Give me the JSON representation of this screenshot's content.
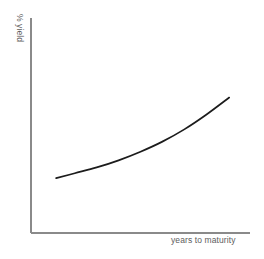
{
  "chart_data": {
    "type": "line",
    "title": "",
    "subtitle": "",
    "xlabel": "years to maturity",
    "ylabel": "% yield",
    "legend": [],
    "legend_position": "none",
    "grid": false,
    "axis_ticks": false,
    "tick_labels": {
      "x": [],
      "y": []
    },
    "xlim": [
      0,
      10
    ],
    "ylim": [
      0,
      10
    ],
    "annotations": [],
    "series": [
      {
        "name": "yield curve",
        "color": "#1c1c1c",
        "x": [
          1.15,
          2.0,
          3.0,
          4.0,
          5.0,
          6.0,
          7.0,
          8.0,
          9.05
        ],
        "y": [
          2.55,
          2.78,
          3.05,
          3.38,
          3.78,
          4.25,
          4.82,
          5.5,
          6.3
        ]
      }
    ]
  },
  "axes": {
    "y_axis_name": "y-axis",
    "x_axis_name": "x-axis"
  },
  "colors": {
    "background": "#ffffff",
    "axis": "#8a8a8a",
    "curve": "#1c1c1c",
    "label_text": "#5d5d5d"
  }
}
